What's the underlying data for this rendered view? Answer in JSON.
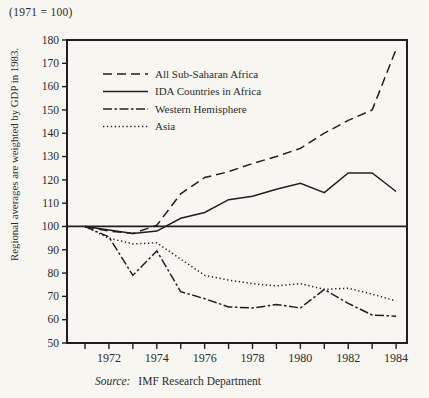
{
  "header": {
    "index_note": "(1971 = 100)"
  },
  "ylabel": "Regional averages are weighted by GDP in 1983.",
  "source": {
    "label": "Source:",
    "text": "IMF Research Department"
  },
  "colors": {
    "ink": "#1f1f1f",
    "text": "#2b2b2b",
    "background": "#f8f6f1"
  },
  "chart_data": {
    "type": "line",
    "title": "(1971 = 100)",
    "ylabel": "Regional averages are weighted by GDP in 1983.",
    "source_note": "Source: IMF Research Department",
    "x": [
      1971,
      1972,
      1973,
      1974,
      1975,
      1976,
      1977,
      1978,
      1979,
      1980,
      1981,
      1982,
      1983,
      1984
    ],
    "series": [
      {
        "name": "All Sub-Saharan Africa",
        "style": "long-dash",
        "values": [
          100,
          98,
          97,
          100.5,
          114,
          121,
          123.5,
          127,
          130,
          133.5,
          140,
          145.5,
          150,
          176
        ]
      },
      {
        "name": "IDA Countries in Africa",
        "style": "solid",
        "values": [
          100,
          98.5,
          97,
          98,
          103.5,
          106,
          111.5,
          113,
          116,
          118.5,
          114.5,
          123,
          123,
          115
        ]
      },
      {
        "name": "Western Hemisphere",
        "style": "dash-dot",
        "values": [
          100,
          95.5,
          79,
          89.5,
          72,
          69,
          65.5,
          65,
          66.5,
          65,
          73,
          67,
          62,
          61.5
        ]
      },
      {
        "name": "Asia",
        "style": "dotted",
        "values": [
          100,
          95,
          92.5,
          93,
          86,
          79,
          77,
          75.5,
          74.5,
          75.5,
          73,
          73.5,
          71,
          68
        ]
      }
    ],
    "reference_line_y": 100,
    "ylim": [
      50,
      180
    ],
    "ytick_step": 10,
    "xtick_years": [
      1971,
      1972,
      1973,
      1974,
      1975,
      1976,
      1977,
      1978,
      1979,
      1980,
      1981,
      1982,
      1983,
      1984
    ],
    "xlabel_years": [
      1972,
      1974,
      1976,
      1978,
      1980,
      1982,
      1984
    ],
    "grid": false,
    "legend_position": "upper-left-inside"
  }
}
